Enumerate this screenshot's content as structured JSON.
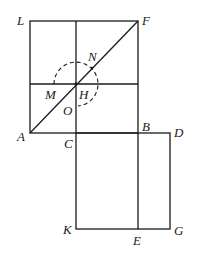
{
  "diagram": {
    "stroke_color": "#1a1a1a",
    "background": "#ffffff",
    "points": {
      "L": {
        "label": "L",
        "x": 30,
        "y": 21
      },
      "F": {
        "label": "F",
        "x": 138,
        "y": 21
      },
      "A": {
        "label": "A",
        "x": 30,
        "y": 133
      },
      "C": {
        "label": "C",
        "x": 76,
        "y": 133
      },
      "B": {
        "label": "B",
        "x": 138,
        "y": 133
      },
      "D": {
        "label": "D",
        "x": 170,
        "y": 133
      },
      "K": {
        "label": "K",
        "x": 76,
        "y": 229
      },
      "E": {
        "label": "E",
        "x": 138,
        "y": 229
      },
      "G": {
        "label": "G",
        "x": 170,
        "y": 229
      },
      "H": {
        "label": "H",
        "x": 76,
        "y": 84
      },
      "M": {
        "label": "M"
      },
      "N": {
        "label": "N"
      },
      "O": {
        "label": "O"
      }
    },
    "segments": [
      "LF",
      "LA",
      "FB",
      "AB",
      "AF",
      "C-vertical-top",
      "M-horizontal",
      "CK",
      "KG",
      "DG",
      "BD",
      "BE"
    ],
    "circle": {
      "center": "H",
      "radius": 22,
      "style": "dashed",
      "open_quadrant": "lower-left"
    }
  }
}
